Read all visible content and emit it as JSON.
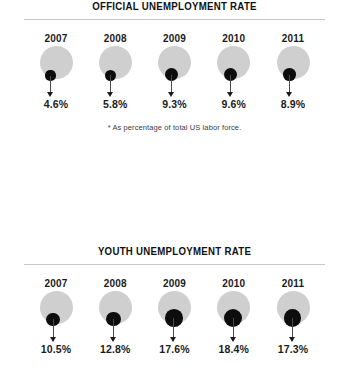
{
  "chart_data": [
    {
      "type": "bar",
      "title": "OFFICIAL UNEMPLOYMENT RATE",
      "subtitle": "* As percentage of total US labor force.",
      "xlabel": "",
      "ylabel": "Unemployment rate (%)",
      "categories": [
        "2007",
        "2008",
        "2009",
        "2010",
        "2011"
      ],
      "values": [
        4.6,
        5.8,
        9.3,
        9.6,
        8.9
      ],
      "value_labels": [
        "4.6%",
        "5.8%",
        "9.3%",
        "9.6%",
        "8.9%"
      ],
      "ylim": [
        0,
        20
      ],
      "grid": false,
      "legend": "none",
      "encoding": "proportional black circle inside fixed gray circle"
    },
    {
      "type": "bar",
      "title": "YOUTH UNEMPLOYMENT RATE",
      "subtitle": "",
      "xlabel": "",
      "ylabel": "Unemployment rate (%)",
      "categories": [
        "2007",
        "2008",
        "2009",
        "2010",
        "2011"
      ],
      "values": [
        10.5,
        12.8,
        17.6,
        18.4,
        17.3
      ],
      "value_labels": [
        "10.5%",
        "12.8%",
        "17.6%",
        "18.4%",
        "17.3%"
      ],
      "ylim": [
        0,
        20
      ],
      "grid": false,
      "legend": "none",
      "encoding": "proportional black circle inside fixed gray circle"
    }
  ],
  "colors": {
    "background": "#ffffff",
    "bubble": "#cfcfcf",
    "dot": "#0d0d0d",
    "rule": "#c9c9c9",
    "text": "#1b1b1b",
    "footnote": "#3d3d3d",
    "stem": "#4a4a4a"
  },
  "official": {
    "title": "OFFICIAL UNEMPLOYMENT RATE",
    "footnote": "* As percentage of total US labor force.",
    "items": [
      {
        "year": "2007",
        "value": "4.6%"
      },
      {
        "year": "2008",
        "value": "5.8%"
      },
      {
        "year": "2009",
        "value": "9.3%"
      },
      {
        "year": "2010",
        "value": "9.6%"
      },
      {
        "year": "2011",
        "value": "8.9%"
      }
    ]
  },
  "youth": {
    "title": "YOUTH UNEMPLOYMENT RATE",
    "items": [
      {
        "year": "2007",
        "value": "10.5%"
      },
      {
        "year": "2008",
        "value": "12.8%"
      },
      {
        "year": "2009",
        "value": "17.6%"
      },
      {
        "year": "2010",
        "value": "18.4%"
      },
      {
        "year": "2011",
        "value": "17.3%"
      }
    ]
  }
}
